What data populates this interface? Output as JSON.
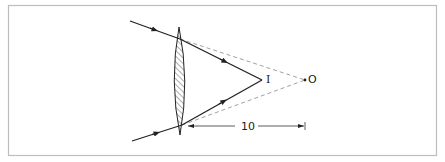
{
  "diagram": {
    "type": "optics-ray-diagram",
    "colors": {
      "frame": "#bdbdbd",
      "ray": "#222222",
      "dashed": "#888888",
      "hatch": "#333333",
      "background": "#ffffff"
    },
    "labels": {
      "image_point": "I",
      "object_point": "O",
      "distance": "10"
    },
    "elements": {
      "lens": "biconvex lens (hatched)",
      "rays": [
        {
          "name": "upper-incoming-ray",
          "direction": "toward lens, arrow pointing right"
        },
        {
          "name": "upper-refracted-ray",
          "direction": "from lens to I"
        },
        {
          "name": "lower-incoming-ray",
          "direction": "toward lens, arrow pointing right"
        },
        {
          "name": "lower-refracted-ray",
          "direction": "from lens to I"
        }
      ],
      "virtual_extensions": [
        "dashed line from upper lens point to O",
        "dashed line from lower lens point to O"
      ],
      "dimension": {
        "from": "lens",
        "to": "O",
        "value": "10"
      }
    }
  }
}
